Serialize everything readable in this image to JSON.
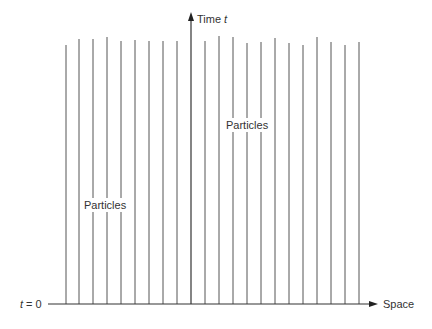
{
  "diagram": {
    "title": "",
    "colors": {
      "line": "#555555",
      "axis": "#333333",
      "text": "#333333",
      "background": "#ffffff"
    },
    "axes": {
      "vertical": {
        "label_main": "Time ",
        "label_var": "t",
        "x": 191,
        "y_bottom": 304,
        "y_top": 12
      },
      "horizontal": {
        "label": "Space",
        "y": 304,
        "x_start": 48,
        "x_end": 378,
        "origin_label_var": "t",
        "origin_label_rest": " = 0"
      }
    },
    "labels": {
      "particles_left": "Particles",
      "particles_right": "Particles"
    },
    "particle_worldlines": [
      {
        "x": 66,
        "top": 45
      },
      {
        "x": 79,
        "top": 39
      },
      {
        "x": 93,
        "top": 39
      },
      {
        "x": 107,
        "top": 37
      },
      {
        "x": 121,
        "top": 41
      },
      {
        "x": 135,
        "top": 40
      },
      {
        "x": 149,
        "top": 41
      },
      {
        "x": 163,
        "top": 41
      },
      {
        "x": 177,
        "top": 41
      },
      {
        "x": 205,
        "top": 41
      },
      {
        "x": 219,
        "top": 36
      },
      {
        "x": 233,
        "top": 37
      },
      {
        "x": 247,
        "top": 43
      },
      {
        "x": 261,
        "top": 42
      },
      {
        "x": 275,
        "top": 38
      },
      {
        "x": 289,
        "top": 43
      },
      {
        "x": 303,
        "top": 45
      },
      {
        "x": 317,
        "top": 37
      },
      {
        "x": 331,
        "top": 42
      },
      {
        "x": 345,
        "top": 45
      },
      {
        "x": 359,
        "top": 42
      }
    ]
  }
}
